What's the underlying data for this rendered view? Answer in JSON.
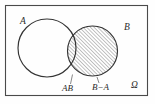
{
  "figure": {
    "type": "venn-diagram",
    "background_color": "#fefefe",
    "outline_color": "#333333",
    "hatch_color": "#3a3a3a"
  },
  "labels": {
    "set_a": "A",
    "set_b": "B",
    "intersection": "AB",
    "difference": "B−A",
    "sample_space": "Ω"
  },
  "geometry": {
    "frame": {
      "x": 5,
      "y": 5,
      "width": 142,
      "height": 90
    },
    "circle_a": {
      "cx": 47,
      "cy": 48,
      "r": 29,
      "filled": false
    },
    "circle_b": {
      "cx": 92.5,
      "cy": 51,
      "r": 25,
      "filled": true
    },
    "hatch_angle_deg": 45,
    "hatch_spacing_px": 2.6
  },
  "label_positions": {
    "set_a": {
      "x": 20,
      "y": 24
    },
    "set_b": {
      "x": 124,
      "y": 30
    },
    "intersection": {
      "x": 62,
      "y": 91
    },
    "difference": {
      "x": 92,
      "y": 90
    },
    "sample_space": {
      "x": 131,
      "y": 88
    }
  }
}
